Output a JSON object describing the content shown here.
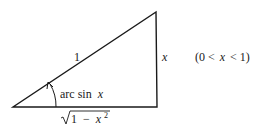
{
  "diagram": {
    "type": "right-triangle",
    "labels": {
      "hypotenuse": "1",
      "opposite": "x",
      "angle_prefix": "arc sin",
      "angle_var": "x",
      "adjacent_one": "1",
      "adjacent_minus": "−",
      "adjacent_var": "x",
      "adjacent_exp": "2",
      "condition_open": "(0 <",
      "condition_var": "x",
      "condition_close": "< 1)"
    },
    "colors": {
      "stroke": "#1a1a1a",
      "background": "#ffffff"
    }
  }
}
